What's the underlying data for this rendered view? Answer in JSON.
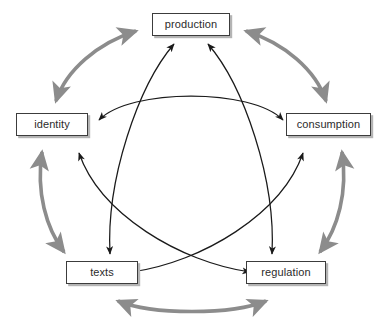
{
  "diagram": {
    "type": "cycle-diagram",
    "canvas": {
      "width": 382,
      "height": 323
    },
    "colors": {
      "background": "#ffffff",
      "box_border": "#3c3c3c",
      "box_fill": "#ffffff",
      "box_shadow": "#b4b4b4",
      "label_text": "#2b2b2b",
      "outer_arrow": "#8c8c8c",
      "inner_arrow": "#1a1a1a"
    },
    "nodes": [
      {
        "id": "production",
        "label": "production",
        "x": 152,
        "y": 13,
        "w": 78,
        "h": 23
      },
      {
        "id": "identity",
        "label": "identity",
        "x": 16,
        "y": 113,
        "w": 72,
        "h": 23
      },
      {
        "id": "consumption",
        "label": "consumption",
        "x": 286,
        "y": 113,
        "w": 85,
        "h": 23
      },
      {
        "id": "texts",
        "label": "texts",
        "x": 66,
        "y": 261,
        "w": 72,
        "h": 23
      },
      {
        "id": "regulation",
        "label": "regulation",
        "x": 246,
        "y": 261,
        "w": 80,
        "h": 23
      }
    ],
    "outer_arrows": [
      {
        "id": "identity-production",
        "from": "identity",
        "to": "production",
        "style": "double-headed-curved",
        "color": "#8c8c8c"
      },
      {
        "id": "production-consumption",
        "from": "production",
        "to": "consumption",
        "style": "double-headed-curved",
        "color": "#8c8c8c"
      },
      {
        "id": "identity-texts",
        "from": "identity",
        "to": "texts",
        "style": "double-headed-curved",
        "color": "#8c8c8c"
      },
      {
        "id": "consumption-regulation",
        "from": "consumption",
        "to": "regulation",
        "style": "double-headed-curved",
        "color": "#8c8c8c"
      },
      {
        "id": "texts-regulation",
        "from": "texts",
        "to": "regulation",
        "style": "double-headed-curved",
        "color": "#8c8c8c"
      }
    ],
    "inner_arrows": [
      {
        "id": "identity-consumption",
        "from": "identity",
        "to": "consumption",
        "style": "double-headed-arc",
        "color": "#1a1a1a"
      },
      {
        "id": "production-texts",
        "from": "production",
        "to": "texts",
        "style": "double-headed-arc",
        "color": "#1a1a1a"
      },
      {
        "id": "production-regulation",
        "from": "production",
        "to": "regulation",
        "style": "double-headed-arc",
        "color": "#1a1a1a"
      },
      {
        "id": "identity-regulation",
        "from": "identity",
        "to": "regulation",
        "style": "double-headed-arc",
        "color": "#1a1a1a"
      },
      {
        "id": "texts-consumption",
        "from": "texts",
        "to": "consumption",
        "style": "double-headed-arc",
        "color": "#1a1a1a"
      }
    ]
  }
}
